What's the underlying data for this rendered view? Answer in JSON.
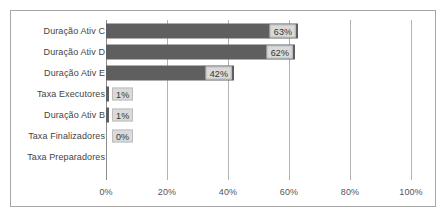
{
  "chart_data": {
    "type": "bar",
    "orientation": "horizontal",
    "title": "",
    "subtitle": "",
    "xlabel": "",
    "ylabel": "",
    "xlim": [
      0,
      100
    ],
    "grid": true,
    "legend": false,
    "legend_position": "none",
    "bar_color": "#5F5F5F",
    "label_box_color": "#DADADA",
    "border_color": "#A6A6A6",
    "gridline_color": "#B3B3B3",
    "axis_tick_labels": [
      "0%",
      "20%",
      "40%",
      "60%",
      "80%",
      "100%"
    ],
    "axis_tick_values": [
      0,
      20,
      40,
      60,
      80,
      100
    ],
    "categories": [
      "Duração Ativ C",
      "Duração Ativ D",
      "Duração Ativ E",
      "Taxa Executores",
      "Duração Ativ B",
      "Taxa Finalizadores",
      "Taxa Preparadores"
    ],
    "values": [
      63,
      62,
      42,
      1,
      1,
      0,
      0
    ],
    "data_labels": [
      "63%",
      "62%",
      "42%",
      "1%",
      "1%",
      "0%",
      ""
    ],
    "points": [
      {
        "category": "Duração Ativ C",
        "value": 63,
        "label": "63%",
        "label_inside": true
      },
      {
        "category": "Duração Ativ D",
        "value": 62,
        "label": "62%",
        "label_inside": true
      },
      {
        "category": "Duração Ativ E",
        "value": 42,
        "label": "42%",
        "label_inside": true
      },
      {
        "category": "Taxa Executores",
        "value": 1,
        "label": "1%",
        "label_inside": false
      },
      {
        "category": "Duração Ativ B",
        "value": 1,
        "label": "1%",
        "label_inside": false
      },
      {
        "category": "Taxa Finalizadores",
        "value": 0,
        "label": "0%",
        "label_inside": false
      },
      {
        "category": "Taxa Preparadores",
        "value": 0,
        "label": "",
        "label_inside": false
      }
    ]
  }
}
